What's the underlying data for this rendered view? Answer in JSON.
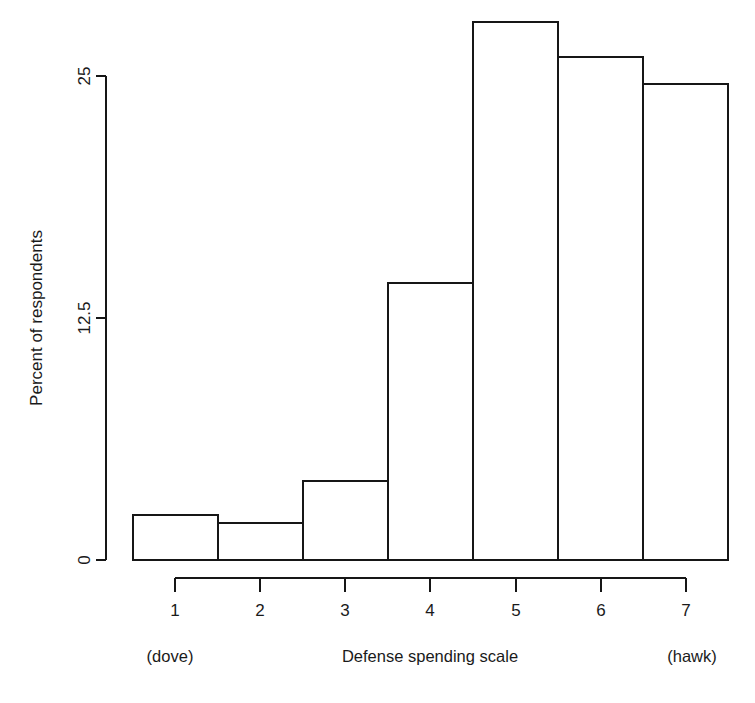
{
  "chart_data": {
    "type": "bar",
    "title": "",
    "subtitle": "",
    "xlabel": "Defense spending scale",
    "ylabel": "Percent of respondents",
    "categories": [
      "1",
      "2",
      "3",
      "4",
      "5",
      "6",
      "7"
    ],
    "values": [
      2.3,
      1.9,
      4.1,
      14.3,
      27.8,
      26.0,
      24.6
    ],
    "series": [
      {
        "name": "Percent of respondents",
        "values": [
          2.3,
          1.9,
          4.1,
          14.3,
          27.8,
          26.0,
          24.6
        ]
      }
    ],
    "ylim": [
      0,
      25
    ],
    "xlim": [
      0.5,
      7.5
    ],
    "ytick_labels": [
      "0",
      "12.5",
      "25"
    ],
    "ytick_values": [
      0,
      12.5,
      25
    ],
    "xtick_labels": [
      "1",
      "2",
      "3",
      "4",
      "5",
      "6",
      "7"
    ],
    "grid": false,
    "legend": null,
    "legend_position": "none",
    "bar_fill_color": "#ffffff",
    "bar_border_color": "#161616",
    "axis_color": "#161616",
    "background_color": "#ffffff",
    "annotations": [
      {
        "text": "(dove)",
        "anchor": "x-axis-left-end"
      },
      {
        "text": "(hawk)",
        "anchor": "x-axis-right-end"
      }
    ]
  },
  "axis": {
    "y_label": "Percent of respondents",
    "y_ticks": [
      "0",
      "12.5",
      "25"
    ],
    "x_ticks": [
      "1",
      "2",
      "3",
      "4",
      "5",
      "6",
      "7"
    ],
    "x_label": "Defense spending scale",
    "left_end_label": "(dove)",
    "right_end_label": "(hawk)"
  }
}
